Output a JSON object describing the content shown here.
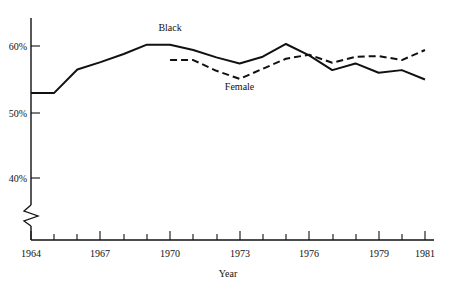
{
  "chart_data": {
    "type": "line",
    "title": "",
    "xlabel": "Year",
    "ylabel": "",
    "xlim": [
      1964,
      1981
    ],
    "ylim": [
      36,
      62
    ],
    "grid": false,
    "legend_position": "inline-annotations",
    "axis_break": true,
    "axis_break_note": "y-axis broken below 40%",
    "x": [
      1964,
      1965,
      1966,
      1967,
      1968,
      1969,
      1970,
      1971,
      1972,
      1973,
      1974,
      1975,
      1976,
      1977,
      1978,
      1979,
      1980,
      1981
    ],
    "ytick_labels": [
      "60%",
      "50%",
      "40%"
    ],
    "ytick_values": [
      60,
      50,
      40
    ],
    "xtick_labels": [
      "1964",
      "1967",
      "1970",
      "1973",
      "1976",
      "1979",
      "1981"
    ],
    "xtick_values": [
      1964,
      1967,
      1970,
      1973,
      1976,
      1979,
      1981
    ],
    "xtick_minor_values": [
      1965,
      1966,
      1968,
      1969,
      1971,
      1972,
      1974,
      1975,
      1977,
      1978,
      1980
    ],
    "series": [
      {
        "name": "Black",
        "style": "solid",
        "color": "#111111",
        "x": [
          1964,
          1965,
          1966,
          1967,
          1968,
          1969,
          1970,
          1971,
          1972,
          1973,
          1974,
          1975,
          1976,
          1977,
          1978,
          1979,
          1980,
          1981
        ],
        "values": [
          53.0,
          53.0,
          56.5,
          57.6,
          58.8,
          60.2,
          60.2,
          59.4,
          58.3,
          57.4,
          58.4,
          60.3,
          58.6,
          56.4,
          57.4,
          56.0,
          56.4,
          55.0
        ]
      },
      {
        "name": "Female",
        "style": "dashed",
        "color": "#111111",
        "x": [
          1970,
          1971,
          1972,
          1973,
          1974,
          1975,
          1976,
          1977,
          1978,
          1979,
          1980,
          1981
        ],
        "values": [
          57.9,
          57.9,
          56.3,
          55.1,
          56.6,
          58.1,
          58.7,
          57.5,
          58.4,
          58.5,
          57.9,
          59.4
        ]
      }
    ],
    "annotations": [
      {
        "text": "Black",
        "x": 1970,
        "y": 62.3
      },
      {
        "text": "Female",
        "x": 1973,
        "y": 53.4
      }
    ]
  }
}
